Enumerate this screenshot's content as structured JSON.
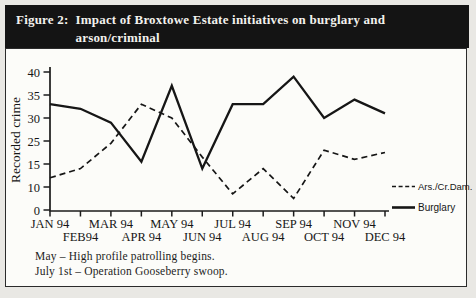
{
  "figure": {
    "title_prefix": "Figure 2:",
    "title_line1": "Impact of Broxtowe Estate initiatives on burglary and arson/criminal",
    "title_line2": "damage (1994)"
  },
  "chart_data": {
    "type": "line",
    "title": "Impact of Broxtowe Estate initiatives on burglary and arson/criminal damage (1994)",
    "ylabel": "Recorded crime",
    "xlabel": "",
    "grid": false,
    "legend_position": "right",
    "categories": [
      "JAN 94",
      "FEB94",
      "MAR 94",
      "APR 94",
      "MAY 94",
      "JUN 94",
      "JUL 94",
      "AUG 94",
      "SEP 94",
      "OCT 94",
      "NOV 94",
      "DEC 94"
    ],
    "y_tick_labels": [
      "40",
      "35",
      "30",
      "25",
      "15",
      "10",
      "0"
    ],
    "series": [
      {
        "name": "Ars./Cr.Dam.",
        "line_style": "dashed",
        "values": [
          12,
          14,
          24,
          33,
          30,
          18,
          7,
          14,
          5,
          21,
          17,
          20
        ]
      },
      {
        "name": "Burglary",
        "line_style": "solid",
        "values": [
          33,
          32,
          29,
          16,
          37,
          14,
          33,
          33,
          39,
          30,
          34,
          31
        ]
      }
    ]
  },
  "footnotes": {
    "line1": "May – High profile patrolling begins.",
    "line2": "July 1st – Operation Gooseberry swoop."
  }
}
